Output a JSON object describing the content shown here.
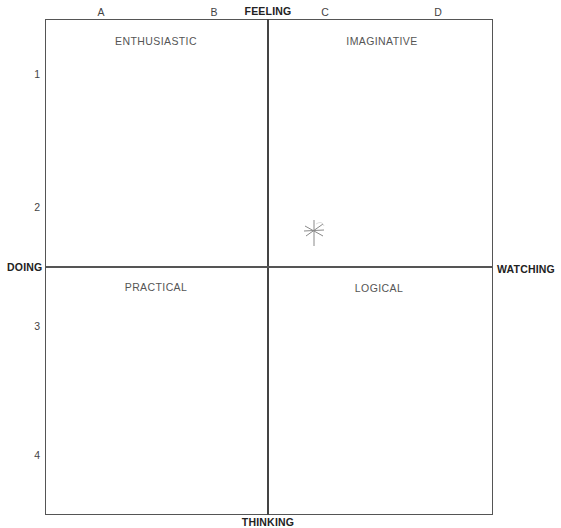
{
  "axes": {
    "top": "FEELING",
    "bottom": "THINKING",
    "left": "DOING",
    "right": "WATCHING"
  },
  "columns": [
    "A",
    "B",
    "C",
    "D"
  ],
  "rows": [
    "1",
    "2",
    "3",
    "4"
  ],
  "quadrants": {
    "top_left": "ENTHUSIASTIC",
    "top_right": "IMAGINATIVE",
    "bottom_left": "PRACTICAL",
    "bottom_right": "LOGICAL"
  },
  "marker": {
    "symbol": "asterisk",
    "quadrant": "top_right",
    "color": "#888888"
  },
  "colors": {
    "lines": "#555555",
    "text": "#444444",
    "background": "#ffffff"
  }
}
